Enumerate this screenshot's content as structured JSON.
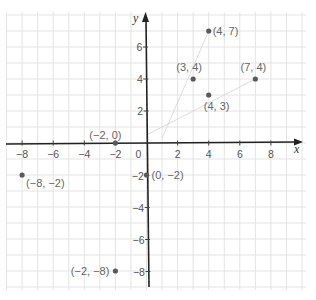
{
  "chart_data": {
    "type": "scatter",
    "title": "",
    "xlabel": "x",
    "ylabel": "y",
    "xlim": [
      -9,
      9
    ],
    "ylim": [
      -9,
      8
    ],
    "grid": true,
    "x_ticks": [
      -8,
      -6,
      -4,
      -2,
      0,
      2,
      4,
      6,
      8
    ],
    "x_tick_labels": [
      "-8",
      "-6",
      "-4",
      "-2",
      "0",
      "2",
      "4",
      "6",
      "8"
    ],
    "y_ticks": [
      -8,
      -6,
      -4,
      -2,
      2,
      4,
      6
    ],
    "y_tick_labels": [
      "-8",
      "-6",
      "-4",
      "-2",
      "2",
      "4",
      "6"
    ],
    "points": [
      {
        "x": 4,
        "y": 7,
        "label": "(4, 7)"
      },
      {
        "x": 3,
        "y": 4,
        "label": "(3, 4)"
      },
      {
        "x": 7,
        "y": 4,
        "label": "(7, 4)"
      },
      {
        "x": 4,
        "y": 3,
        "label": "(4, 3)"
      },
      {
        "x": -2,
        "y": 0,
        "label": "(−2, 0)"
      },
      {
        "x": 0,
        "y": -2,
        "label": "(0, −2)"
      },
      {
        "x": -8,
        "y": -2,
        "label": "(−8, −2)"
      },
      {
        "x": -2,
        "y": -8,
        "label": "(−2, −8)"
      }
    ],
    "faint_lines": [
      {
        "from": [
          1,
          0.3
        ],
        "to": [
          4,
          7
        ]
      },
      {
        "from": [
          0,
          0.5
        ],
        "to": [
          7,
          4
        ]
      }
    ]
  },
  "colors": {
    "point": "#5a5a5a",
    "label": "#666666",
    "axis": "#222222",
    "grid": "#e4e4e4"
  }
}
